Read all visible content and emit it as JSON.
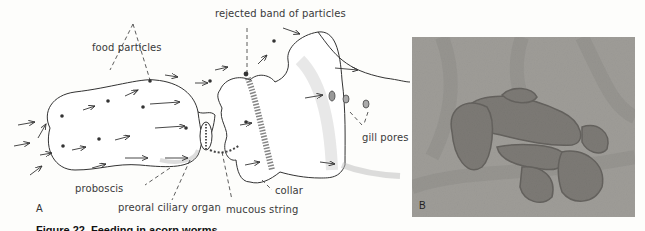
{
  "figure": {
    "panel_a": {
      "letter": "A",
      "labels": {
        "food_particles": "food particles",
        "rejected_band": "rejected band of particles",
        "proboscis": "proboscis",
        "preoral_ciliary_organ": "preoral ciliary organ",
        "mucous_string": "mucous string",
        "collar": "collar",
        "gill_pores": "gill pores"
      }
    },
    "panel_b": {
      "letter": "B"
    },
    "caption_partial": "Figure 22. Feeding in acorn worms"
  }
}
